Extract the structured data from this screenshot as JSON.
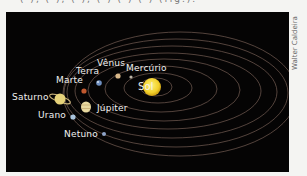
{
  "caption_top": "( ), ( ), ( ), ( ) ( ) ( ) (fig.).",
  "credit": "Walter Caldeira",
  "diagram": {
    "background": "#050404",
    "orbit_color": "#8a6f63",
    "bodies": [
      {
        "name": "Sol",
        "color": "#f5d93a"
      },
      {
        "name": "Mercúrio",
        "color": "#bdb6a8"
      },
      {
        "name": "Vênus",
        "color": "#d9b88a"
      },
      {
        "name": "Terra",
        "color": "#6f8fc0"
      },
      {
        "name": "Marte",
        "color": "#c0582e"
      },
      {
        "name": "Júpiter",
        "color": "#e8d9a0"
      },
      {
        "name": "Saturno",
        "color": "#e6d27a"
      },
      {
        "name": "Urano",
        "color": "#a9c4dd"
      },
      {
        "name": "Netuno",
        "color": "#8fa4c8"
      }
    ]
  }
}
